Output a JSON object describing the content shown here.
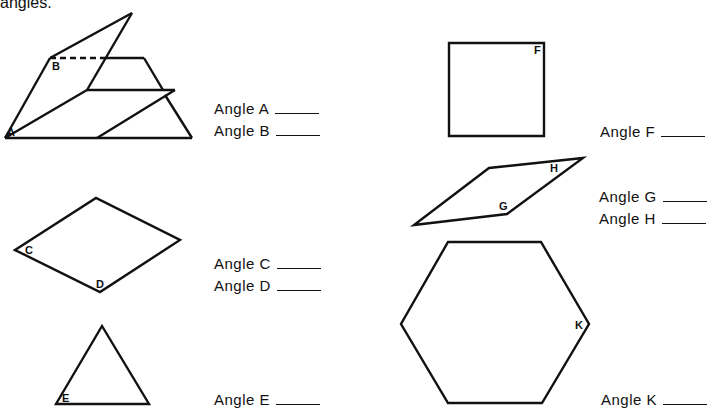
{
  "header": {
    "text": "angles."
  },
  "shapes": {
    "A": "A",
    "B": "B",
    "C": "C",
    "D": "D",
    "E": "E",
    "F": "F",
    "G": "G",
    "H": "H",
    "K": "K"
  },
  "answers": [
    {
      "id": "A",
      "label": "Angle A",
      "value": ""
    },
    {
      "id": "B",
      "label": "Angle B",
      "value": ""
    },
    {
      "id": "C",
      "label": "Angle C",
      "value": ""
    },
    {
      "id": "D",
      "label": "Angle D",
      "value": ""
    },
    {
      "id": "E",
      "label": "Angle E",
      "value": ""
    },
    {
      "id": "F",
      "label": "Angle F",
      "value": ""
    },
    {
      "id": "G",
      "label": "Angle G",
      "value": ""
    },
    {
      "id": "H",
      "label": "Angle H",
      "value": ""
    },
    {
      "id": "K",
      "label": "Angle K",
      "value": ""
    }
  ]
}
